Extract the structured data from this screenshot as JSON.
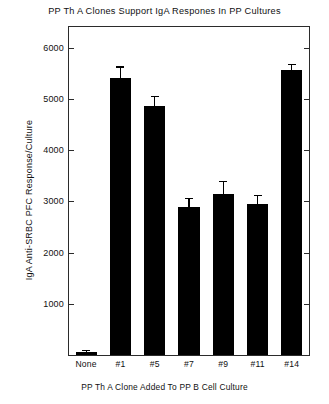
{
  "chart_data": {
    "type": "bar",
    "title": "PP Th A Clones Support IgA Respones In PP Cultures",
    "xlabel": "PP Th A Clone Added To PP B Cell Culture",
    "ylabel": "IgA Anti-SRBC PFC Response/Culture",
    "categories": [
      "None",
      "#1",
      "#5",
      "#7",
      "#9",
      "#11",
      "#14"
    ],
    "values": [
      60,
      5400,
      4860,
      2880,
      3150,
      2950,
      5560
    ],
    "errors": [
      40,
      230,
      190,
      190,
      250,
      180,
      120
    ],
    "series": [
      {
        "name": "IgA Anti-SRBC PFC Response/Culture",
        "values": [
          60,
          5400,
          4860,
          2880,
          3150,
          2950,
          5560
        ],
        "errors": [
          40,
          230,
          190,
          190,
          250,
          180,
          120
        ]
      }
    ],
    "ylim": [
      0,
      6400
    ],
    "yticks": [
      1000,
      2000,
      3000,
      4000,
      5000,
      6000
    ],
    "ytick_labels": [
      "1000",
      "2000",
      "3000",
      "4000",
      "5000",
      "6000"
    ],
    "grid": false,
    "legend": "none",
    "bar_color": "#000000",
    "frame_color": "#2b2b2b",
    "background": "#ffffff"
  }
}
